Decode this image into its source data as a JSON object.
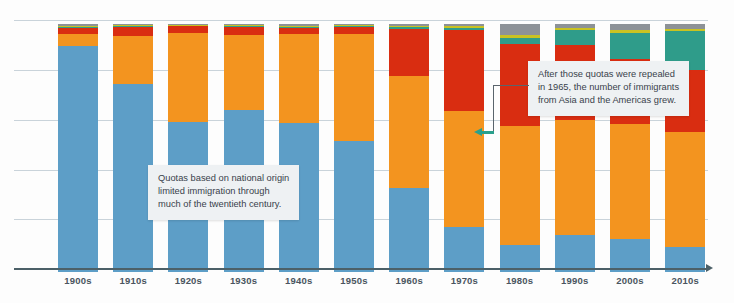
{
  "chart_data": {
    "type": "bar",
    "subtype": "stacked-bar",
    "title": "",
    "subtitle": "",
    "xlabel": "",
    "ylabel": "",
    "grid": true,
    "gridlines": 5,
    "legend_position": "none",
    "categories": [
      "1900s",
      "1910s",
      "1920s",
      "1930s",
      "1940s",
      "1950s",
      "1960s",
      "1970s",
      "1980s",
      "1990s",
      "2000s",
      "2010s"
    ],
    "series": [
      {
        "name": "Europe",
        "color": "#5d9ec7",
        "values": [
          91.0,
          76.0,
          60.5,
          65.5,
          60.0,
          53.0,
          34.0,
          18.0,
          11.0,
          15.0,
          13.5,
          10.0
        ]
      },
      {
        "name": "Americas",
        "color": "#f3941f",
        "values": [
          5.0,
          19.0,
          36.0,
          30.0,
          36.0,
          43.0,
          45.0,
          47.0,
          48.0,
          46.5,
          46.0,
          46.5
        ]
      },
      {
        "name": "Asia",
        "color": "#d92d11",
        "values": [
          2.5,
          4.0,
          2.6,
          3.5,
          2.5,
          3.0,
          19.0,
          32.5,
          33.0,
          30.0,
          26.5,
          25.0
        ]
      },
      {
        "name": "Africa",
        "color": "#2f9c8a",
        "values": [
          0.3,
          0.3,
          0.3,
          0.3,
          0.3,
          0.4,
          0.8,
          1.0,
          2.5,
          6.0,
          10.5,
          15.5
        ]
      },
      {
        "name": "Oceania",
        "color": "#c9c222",
        "values": [
          0.4,
          0.4,
          0.3,
          0.3,
          0.6,
          0.4,
          0.6,
          0.6,
          0.9,
          1.0,
          1.0,
          1.0
        ]
      },
      {
        "name": "Not specified",
        "color": "#8d9297",
        "values": [
          0.8,
          0.3,
          0.3,
          0.4,
          0.6,
          0.2,
          0.6,
          0.9,
          4.6,
          1.5,
          2.5,
          2.0
        ]
      }
    ],
    "ylim": [
      0,
      100
    ],
    "units": "percent of total immigrants"
  },
  "axis": {
    "tick_labels": [
      "1900s",
      "1910s",
      "1920s",
      "1930s",
      "1940s",
      "1950s",
      "1960s",
      "1970s",
      "1980s",
      "1990s",
      "2000s",
      "2010s"
    ]
  },
  "annotations": [
    {
      "id": "quotas-note",
      "lines": [
        "Quotas based on national origin",
        "limited immigration through",
        "much of the twentieth century."
      ]
    },
    {
      "id": "repeal-note",
      "lines": [
        "After those quotas were repealed",
        "in 1965, the number of immigrants",
        "from Asia and the Americas grew."
      ]
    }
  ],
  "colors": {
    "background": "#fdfdfd",
    "gridline": "#c9d3da",
    "axis": "#4c6068",
    "annotation_bg": "#eef1f3",
    "annotation_text": "#39424b",
    "leader": "#5a646c",
    "leader_arrow": "#2aa08c",
    "label_text": "#4a5560"
  }
}
